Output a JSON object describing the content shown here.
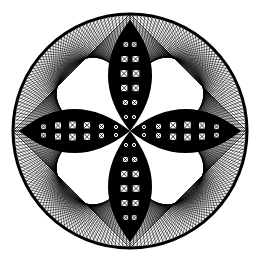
{
  "image": {
    "subject": "circular string-art pattern with four-petal flower",
    "width": 260,
    "height": 263,
    "background": "#ffffff",
    "ink": "#000000",
    "circle": {
      "cx": 130,
      "cy": 131,
      "r": 117,
      "stroke_width": 3
    },
    "petals": {
      "count": 4,
      "half_width": 22,
      "lattice_cells_per_petal_half": 6
    },
    "rays_per_quadrant": 48
  }
}
